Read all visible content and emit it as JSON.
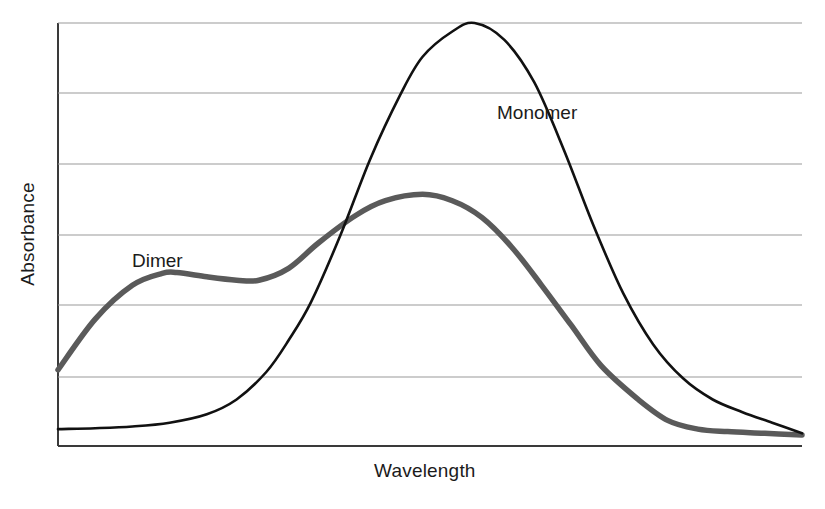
{
  "figure": {
    "background_color": "#ffffff",
    "axis_color": "#3a3a3a",
    "grid_color": "#9a9a9a"
  },
  "axes": {
    "y_title": "Absorbance",
    "x_title": "Wavelength"
  },
  "labels": {
    "monomer": "Monomer",
    "dimer": "Dimer"
  },
  "chart_data": {
    "type": "line",
    "title": "",
    "subtitle": "",
    "xlabel": "Wavelength",
    "ylabel": "Absorbance",
    "xlim": [
      0,
      1
    ],
    "ylim": [
      0,
      1
    ],
    "grid": true,
    "x_ticks": [],
    "y_ticks": [],
    "gridline_count": 7,
    "legend_position": "inline-annotation",
    "annotations": [
      {
        "text": "Monomer",
        "x": 0.59,
        "y": 0.79,
        "series": "Monomer"
      },
      {
        "text": "Dimer",
        "x": 0.1,
        "y": 0.44,
        "series": "Dimer"
      }
    ],
    "series": [
      {
        "name": "Monomer",
        "color": "#111111",
        "line_width": 2.6,
        "x": [
          0.0,
          0.05,
          0.1,
          0.15,
          0.2,
          0.24,
          0.28,
          0.31,
          0.34,
          0.38,
          0.42,
          0.46,
          0.49,
          0.53,
          0.56,
          0.6,
          0.64,
          0.68,
          0.72,
          0.76,
          0.8,
          0.84,
          0.88,
          0.92,
          0.96,
          1.0
        ],
        "y": [
          0.04,
          0.042,
          0.046,
          0.055,
          0.075,
          0.11,
          0.175,
          0.25,
          0.34,
          0.5,
          0.68,
          0.83,
          0.92,
          0.98,
          1.0,
          0.96,
          0.86,
          0.7,
          0.52,
          0.36,
          0.24,
          0.16,
          0.11,
          0.08,
          0.055,
          0.03
        ],
        "peak_x": 0.495,
        "peak_y": 1.0,
        "baseline_y": 0.04
      },
      {
        "name": "Dimer",
        "color": "#5a5a5a",
        "line_width": 5.5,
        "x": [
          0.0,
          0.05,
          0.1,
          0.14,
          0.16,
          0.2,
          0.24,
          0.27,
          0.31,
          0.35,
          0.4,
          0.44,
          0.49,
          0.53,
          0.57,
          0.61,
          0.65,
          0.69,
          0.73,
          0.78,
          0.82,
          0.86,
          0.9,
          0.95,
          1.0
        ],
        "y": [
          0.18,
          0.3,
          0.38,
          0.408,
          0.41,
          0.4,
          0.392,
          0.392,
          0.42,
          0.48,
          0.545,
          0.58,
          0.595,
          0.58,
          0.54,
          0.47,
          0.38,
          0.285,
          0.19,
          0.11,
          0.06,
          0.04,
          0.034,
          0.03,
          0.026
        ],
        "peak_x": 0.49,
        "peak_y": 0.595,
        "start_y": 0.18,
        "shoulder_x": 0.164,
        "shoulder_y": 0.41
      }
    ],
    "crossover": {
      "x": 0.312,
      "y": 0.335
    }
  }
}
